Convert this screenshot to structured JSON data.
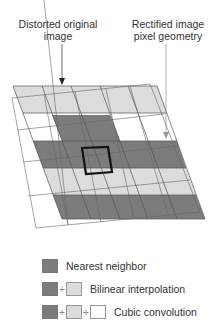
{
  "labels": {
    "distorted": "Distorted original image",
    "distorted_line1": "Distorted original",
    "distorted_line2": "image",
    "rectified_line1": "Rectified image",
    "rectified_line2": "pixel geometry"
  },
  "legend": [
    {
      "label": "Nearest neighbor",
      "swatches": [
        "dark"
      ]
    },
    {
      "label": "Bilinear interpolation",
      "swatches": [
        "dark",
        "light"
      ]
    },
    {
      "label": "Cubic convolution",
      "swatches": [
        "dark",
        "light",
        "white"
      ]
    }
  ],
  "legend_plus": "+",
  "colors": {
    "dark": "#7c7c7c",
    "light": "#dcdcdc",
    "white": "#ffffff",
    "grid_line": "#555555",
    "highlight": "#111111"
  }
}
